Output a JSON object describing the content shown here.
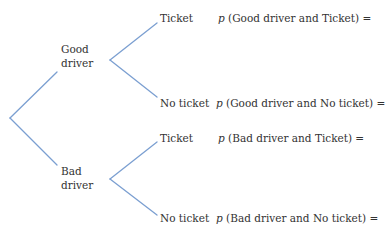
{
  "diagram": {
    "type": "probability-tree",
    "line_color": "#7b9fd1",
    "level1": [
      {
        "label_line1": "Good",
        "label_line2": "driver",
        "branches": [
          {
            "label": "Ticket",
            "expr_p": "p",
            "expr_text": "(Good driver and Ticket) ="
          },
          {
            "label": "No ticket",
            "expr_p": "p",
            "expr_text": "(Good driver and No ticket) ="
          }
        ]
      },
      {
        "label_line1": "Bad",
        "label_line2": "driver",
        "branches": [
          {
            "label": "Ticket",
            "expr_p": "p",
            "expr_text": "(Bad driver and Ticket) ="
          },
          {
            "label": "No ticket",
            "expr_p": "p",
            "expr_text": "(Bad driver and No ticket) ="
          }
        ]
      }
    ]
  }
}
